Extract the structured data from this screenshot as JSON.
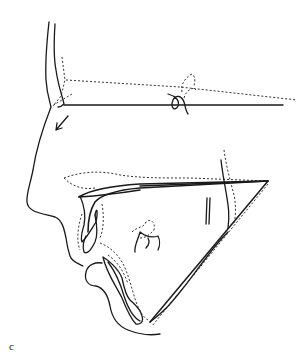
{
  "figure": {
    "panel_label": "c",
    "line_color": "#1a1a1a",
    "background": "#ffffff"
  }
}
